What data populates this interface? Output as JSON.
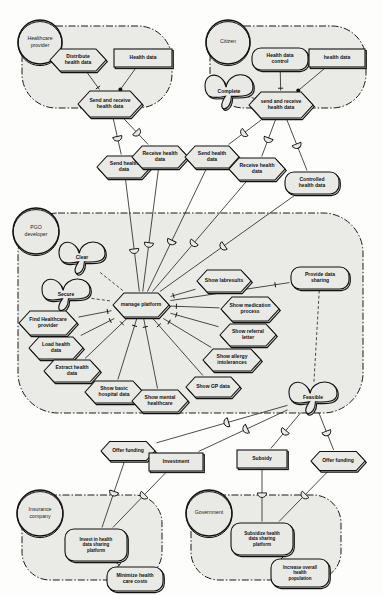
{
  "diagram": {
    "colors": {
      "fill": "#e9e9e6",
      "stroke": "#111111",
      "boundary": "#111111",
      "page": "#fdfdfc"
    }
  },
  "boundaries": [
    {
      "id": "healthcare-provider",
      "actor": "Healthcare provider",
      "actor_cx": 40,
      "actor_cy": 42,
      "actor_r": 22,
      "x": 22,
      "y": 26,
      "w": 150,
      "h": 82,
      "r": 34
    },
    {
      "id": "citizen",
      "actor": "Citizen",
      "actor_cx": 228,
      "actor_cy": 42,
      "actor_r": 22,
      "x": 210,
      "y": 26,
      "w": 156,
      "h": 82,
      "r": 34
    },
    {
      "id": "pgo-developer",
      "actor": "PGO developer",
      "actor_cx": 36,
      "actor_cy": 231,
      "actor_r": 23,
      "x": 18,
      "y": 213,
      "w": 345,
      "h": 200,
      "r": 40
    },
    {
      "id": "insurance-company",
      "actor": "Insurance company",
      "actor_cx": 40,
      "actor_cy": 513,
      "actor_r": 23,
      "x": 22,
      "y": 495,
      "w": 140,
      "h": 85,
      "r": 28
    },
    {
      "id": "government",
      "actor": "Government",
      "actor_cx": 209,
      "actor_cy": 513,
      "actor_r": 23,
      "x": 191,
      "y": 495,
      "w": 150,
      "h": 85,
      "r": 28
    }
  ],
  "nodes": [
    {
      "id": "distribute-health-data",
      "label": "Distribute health data",
      "shape": "hexagon",
      "cx": 78,
      "cy": 60,
      "w": 56,
      "h": 22
    },
    {
      "id": "health-data-hp",
      "label": "Health data",
      "shape": "rect",
      "cx": 143,
      "cy": 58,
      "w": 58,
      "h": 18
    },
    {
      "id": "send-and-receive-health-data-hp",
      "label": "Send and receive health data",
      "shape": "hexagon",
      "cx": 110,
      "cy": 104,
      "w": 64,
      "h": 26
    },
    {
      "id": "health-data-control",
      "label": "Health data control",
      "shape": "roundrect",
      "cx": 280,
      "cy": 59,
      "w": 56,
      "h": 22
    },
    {
      "id": "health-data-citizen",
      "label": "health data",
      "shape": "rect",
      "cx": 337,
      "cy": 58,
      "w": 56,
      "h": 18
    },
    {
      "id": "complete",
      "label": "Complete",
      "shape": "cloud",
      "cx": 229,
      "cy": 92,
      "w": 48,
      "h": 28
    },
    {
      "id": "send-and-receive-health-data-citizen",
      "label": "send and receive health data",
      "shape": "hexagon",
      "cx": 281,
      "cy": 105,
      "w": 64,
      "h": 26
    },
    {
      "id": "send-health-data-left",
      "label": "Send health data",
      "shape": "hexagon",
      "cx": 124,
      "cy": 167,
      "w": 54,
      "h": 22
    },
    {
      "id": "receive-health-data-left",
      "label": "Receive health data",
      "shape": "hexagon",
      "cx": 160,
      "cy": 157,
      "w": 56,
      "h": 22
    },
    {
      "id": "send-health-data-right",
      "label": "Send health data",
      "shape": "hexagon",
      "cx": 212,
      "cy": 157,
      "w": 54,
      "h": 22
    },
    {
      "id": "receive-health-data-right",
      "label": "Receive health data",
      "shape": "hexagon",
      "cx": 257,
      "cy": 169,
      "w": 56,
      "h": 22
    },
    {
      "id": "controlled-health-data",
      "label": "Controlled health data",
      "shape": "roundrect",
      "cx": 312,
      "cy": 183,
      "w": 54,
      "h": 22
    },
    {
      "id": "clear",
      "label": "Clear",
      "shape": "cloud",
      "cx": 82,
      "cy": 258,
      "w": 46,
      "h": 26
    },
    {
      "id": "secure",
      "label": "Secure",
      "shape": "cloud",
      "cx": 66,
      "cy": 295,
      "w": 48,
      "h": 26
    },
    {
      "id": "manage-platform",
      "label": "manage platform",
      "shape": "hexagon",
      "cx": 141,
      "cy": 305,
      "w": 56,
      "h": 24
    },
    {
      "id": "find-healthcare-provider",
      "label": "Find Healthcare provider",
      "shape": "hexagon",
      "cx": 48,
      "cy": 323,
      "w": 58,
      "h": 24
    },
    {
      "id": "load-health-data",
      "label": "Load health data",
      "shape": "hexagon",
      "cx": 56,
      "cy": 348,
      "w": 54,
      "h": 22
    },
    {
      "id": "extract-health-data",
      "label": "Extract health data",
      "shape": "hexagon",
      "cx": 72,
      "cy": 371,
      "w": 56,
      "h": 22
    },
    {
      "id": "show-basic-hospital-data",
      "label": "Show basic hospital data",
      "shape": "hexagon",
      "cx": 114,
      "cy": 392,
      "w": 58,
      "h": 22
    },
    {
      "id": "show-mental-healthcare",
      "label": "Show mental healthcare",
      "shape": "hexagon",
      "cx": 160,
      "cy": 401,
      "w": 56,
      "h": 22
    },
    {
      "id": "show-gp-data",
      "label": "Show GP data",
      "shape": "hexagon",
      "cx": 213,
      "cy": 387,
      "w": 54,
      "h": 20
    },
    {
      "id": "show-allergy-intolerances",
      "label": "Show allergy intolerances",
      "shape": "hexagon",
      "cx": 232,
      "cy": 360,
      "w": 58,
      "h": 22
    },
    {
      "id": "show-referral-letter",
      "label": "Show referral letter",
      "shape": "hexagon",
      "cx": 248,
      "cy": 335,
      "w": 56,
      "h": 22
    },
    {
      "id": "show-medication-process",
      "label": "Show medication process",
      "shape": "hexagon",
      "cx": 250,
      "cy": 309,
      "w": 58,
      "h": 24
    },
    {
      "id": "show-labresults",
      "label": "Show labresults",
      "shape": "hexagon",
      "cx": 224,
      "cy": 281,
      "w": 54,
      "h": 22
    },
    {
      "id": "provide-data-sharing",
      "label": "Provide data sharing",
      "shape": "roundrect",
      "cx": 320,
      "cy": 278,
      "w": 58,
      "h": 22
    },
    {
      "id": "feasible",
      "label": "Feasible",
      "shape": "cloud",
      "cx": 313,
      "cy": 398,
      "w": 48,
      "h": 26
    },
    {
      "id": "offer-funding-left",
      "label": "Offer funding",
      "shape": "hexagon",
      "cx": 128,
      "cy": 451,
      "w": 54,
      "h": 19
    },
    {
      "id": "investment",
      "label": "Investment",
      "shape": "rect",
      "cx": 176,
      "cy": 462,
      "w": 54,
      "h": 18
    },
    {
      "id": "subsidy",
      "label": "Subsidy",
      "shape": "rect",
      "cx": 262,
      "cy": 459,
      "w": 50,
      "h": 18
    },
    {
      "id": "offer-funding-right",
      "label": "Offer funding",
      "shape": "hexagon",
      "cx": 338,
      "cy": 461,
      "w": 54,
      "h": 19
    },
    {
      "id": "invest-in-health-data-sharing-platform",
      "label": "Invest in health data sharing platform",
      "shape": "roundrect",
      "cx": 96,
      "cy": 545,
      "w": 62,
      "h": 32
    },
    {
      "id": "minimize-health-care-costs",
      "label": "Minimize health care costs",
      "shape": "roundrect",
      "cx": 135,
      "cy": 579,
      "w": 56,
      "h": 24
    },
    {
      "id": "subsidize-health-data-sharing-platform",
      "label": "Subsidize health data sharing platform",
      "shape": "roundrect",
      "cx": 262,
      "cy": 539,
      "w": 62,
      "h": 32
    },
    {
      "id": "increase-overall-health-population",
      "label": "Increase overall health population",
      "shape": "roundrect",
      "cx": 300,
      "cy": 573,
      "w": 58,
      "h": 28
    }
  ],
  "connectors": {
    "dependency_count": 16,
    "note": "half-circle dependum glyphs on dependency links"
  },
  "legend": {
    "shapes": {
      "hexagon": "task",
      "rect": "resource",
      "roundrect": "goal",
      "cloud": "softgoal",
      "circle": "actor",
      "dashed-boundary": "actor boundary"
    }
  }
}
